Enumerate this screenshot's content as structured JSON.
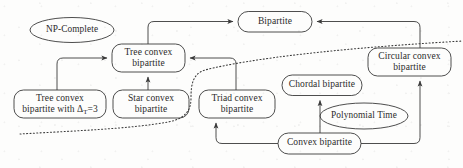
{
  "diagram": {
    "stroke_color": "#3a3a3a",
    "text_color": "#2b2b2b",
    "background_color": "#fdfdfc",
    "nodes": [
      {
        "id": "np_complete",
        "shape": "ellipse",
        "lines": [
          "NP-Complete"
        ]
      },
      {
        "id": "bipartite",
        "shape": "rounded",
        "lines": [
          "Bipartite"
        ]
      },
      {
        "id": "tree_convex",
        "shape": "rounded",
        "lines": [
          "Tree convex",
          "bipartite"
        ]
      },
      {
        "id": "circular_convex",
        "shape": "rounded",
        "lines": [
          "Circular convex",
          "bipartite"
        ]
      },
      {
        "id": "tree_convex_delta3",
        "shape": "rounded",
        "lines": [
          "Tree convex",
          "bipartite with Δ",
          "T",
          "=3"
        ]
      },
      {
        "id": "star_convex",
        "shape": "rounded",
        "lines": [
          "Star convex",
          "bipartite"
        ]
      },
      {
        "id": "triad_convex",
        "shape": "rounded",
        "lines": [
          "Triad convex",
          "bipartite"
        ]
      },
      {
        "id": "chordal_bipartite",
        "shape": "rounded",
        "lines": [
          "Chordal bipartite"
        ]
      },
      {
        "id": "polynomial_time",
        "shape": "ellipse",
        "lines": [
          "Polynomial Time"
        ]
      },
      {
        "id": "convex_bipartite",
        "shape": "rounded",
        "lines": [
          "Convex bipartite"
        ]
      }
    ],
    "labels": {
      "np_complete": "NP-Complete",
      "bipartite": "Bipartite",
      "tree_convex_l1": "Tree convex",
      "tree_convex_l2": "bipartite",
      "circular_convex_l1": "Circular convex",
      "circular_convex_l2": "bipartite",
      "tree_convex_delta3_l1": "Tree convex",
      "tree_convex_delta3_l2_pre": "bipartite with Δ",
      "tree_convex_delta3_l2_sub": "T",
      "tree_convex_delta3_l2_post": "=3",
      "star_convex_l1": "Star convex",
      "star_convex_l2": "bipartite",
      "triad_convex_l1": "Triad convex",
      "triad_convex_l2": "bipartite",
      "chordal_bipartite": "Chordal bipartite",
      "polynomial_time": "Polynomial Time",
      "convex_bipartite": "Convex bipartite"
    },
    "edges": [
      {
        "from": "tree_convex",
        "to": "bipartite",
        "style": "solid"
      },
      {
        "from": "circular_convex",
        "to": "bipartite",
        "style": "solid"
      },
      {
        "from": "tree_convex_delta3",
        "to": "tree_convex",
        "style": "solid"
      },
      {
        "from": "star_convex",
        "to": "tree_convex",
        "style": "solid"
      },
      {
        "from": "triad_convex",
        "to": "tree_convex",
        "style": "solid"
      },
      {
        "from": "convex_bipartite",
        "to": "triad_convex",
        "style": "solid"
      },
      {
        "from": "convex_bipartite",
        "to": "chordal_bipartite",
        "style": "solid"
      },
      {
        "from": "convex_bipartite",
        "to": "circular_convex",
        "style": "solid"
      }
    ],
    "separator": {
      "id": "complexity-boundary",
      "style": "dotted",
      "meaning": "boundary between NP-Complete region (above-left) and Polynomial Time region (below-right)"
    }
  }
}
